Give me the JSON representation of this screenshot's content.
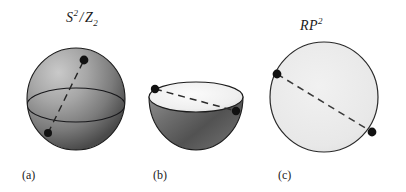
{
  "figure": {
    "background_color": "#ffffff",
    "width": 406,
    "height": 192,
    "labels": {
      "quotient": {
        "base": "S",
        "exponent": "2",
        "slash": "/",
        "group_base": "Z",
        "group_sub": "2",
        "plain": "S2 / Z2"
      },
      "projective_plane": {
        "base": "RP",
        "exponent": "2",
        "plain": "RP2"
      }
    },
    "captions": {
      "a": "(a)",
      "b": "(b)",
      "c": "(c)"
    },
    "panels": [
      {
        "id": "a",
        "name": "sphere-with-antipodal-points",
        "caption": "(a)",
        "title": "S2 / Z2",
        "shape": "sphere",
        "center_x": 76,
        "center_y": 99,
        "radius_x": 49,
        "radius_y": 51,
        "equator": {
          "center_y": 105,
          "radius_y": 17
        },
        "dashed_line": {
          "x1": 48,
          "y1": 133,
          "x2": 84,
          "y2": 60
        },
        "points": [
          {
            "x": 84,
            "y": 60,
            "r": 4.4
          },
          {
            "x": 48,
            "y": 133,
            "r": 4.0
          }
        ],
        "fill_light": "#b9b9b9",
        "fill_dark": "#4d4d4d",
        "stroke": "#1c1c1c"
      },
      {
        "id": "b",
        "name": "hemisphere-bowl",
        "caption": "(b)",
        "shape": "hemisphere",
        "center_x": 196,
        "rim_center_y": 97,
        "radius_x": 47,
        "rim_radius_y": 15,
        "bottom_y": 150,
        "dashed_line": {
          "x1": 155,
          "y1": 89,
          "x2": 236,
          "y2": 111
        },
        "points": [
          {
            "x": 155,
            "y": 89,
            "r": 4.2
          },
          {
            "x": 236,
            "y": 111,
            "r": 4.2
          }
        ],
        "interior_fill": "#f2f2f2",
        "fill_light": "#a8a8a8",
        "fill_dark": "#3f3f3f",
        "stroke": "#1c1c1c"
      },
      {
        "id": "c",
        "name": "projective-plane-disk",
        "caption": "(c)",
        "title": "RP2",
        "shape": "disk",
        "center_x": 324,
        "center_y": 97,
        "radius_x": 54,
        "radius_y": 55,
        "dashed_line": {
          "x1": 277,
          "y1": 74,
          "x2": 372,
          "y2": 132
        },
        "points": [
          {
            "x": 277,
            "y": 74,
            "r": 4.4
          },
          {
            "x": 372,
            "y": 132,
            "r": 4.4
          }
        ],
        "fill": "#ececec",
        "stroke": "#2a2a2a"
      }
    ],
    "style": {
      "dash_pattern": "7,5",
      "dash_color": "#2b2b2b",
      "dot_color": "#111111"
    }
  }
}
